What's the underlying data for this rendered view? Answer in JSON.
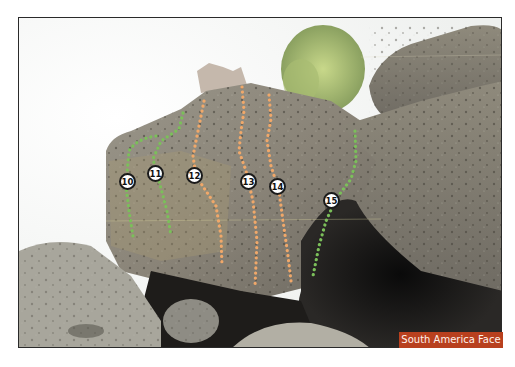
{
  "image": {
    "description": "Photo of a large porous boulder with dotted climbing route lines and numbered route markers",
    "caption_label": "South America Face",
    "caption_color": "#b8401e",
    "route_colors": {
      "green": "#7bbf5a",
      "orange": "#f0a86a"
    }
  },
  "routes": [
    {
      "number": "10",
      "color": "green"
    },
    {
      "number": "11",
      "color": "green"
    },
    {
      "number": "12",
      "color": "orange"
    },
    {
      "number": "13",
      "color": "orange"
    },
    {
      "number": "14",
      "color": "orange"
    },
    {
      "number": "15",
      "color": "green"
    }
  ]
}
